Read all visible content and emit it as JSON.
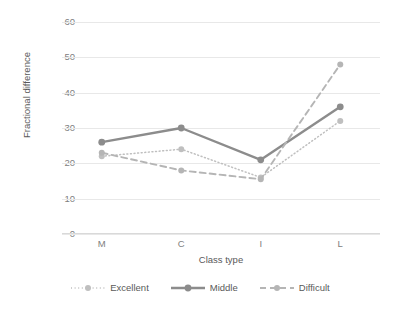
{
  "chart_data": {
    "type": "line",
    "title": "",
    "xlabel": "Class type",
    "ylabel": "Fractional difference",
    "categories": [
      "M",
      "C",
      "I",
      "L"
    ],
    "ylim": [
      0,
      60
    ],
    "yticks": [
      0,
      10,
      20,
      30,
      40,
      50,
      60
    ],
    "grid": true,
    "legend_position": "bottom",
    "series": [
      {
        "name": "Excellent",
        "values": [
          22,
          24,
          16,
          32
        ],
        "color": "#bfbfbf",
        "linestyle": "dotted",
        "marker": "circle"
      },
      {
        "name": "Middle",
        "values": [
          26,
          30,
          21,
          36
        ],
        "color": "#8c8c8c",
        "linestyle": "solid",
        "marker": "circle"
      },
      {
        "name": "Difficult",
        "values": [
          23,
          18,
          15.5,
          48
        ],
        "color": "#b5b5b5",
        "linestyle": "dashed",
        "marker": "circle"
      }
    ]
  },
  "axes": {
    "y_title": "Fractional difference",
    "x_title": "Class type",
    "y_tick_labels": [
      "60",
      "50",
      "40",
      "30",
      "20",
      "10",
      "0"
    ],
    "x_tick_labels": [
      "M",
      "C",
      "I",
      "L"
    ]
  },
  "legend": {
    "items": [
      {
        "label": "Excellent"
      },
      {
        "label": "Middle"
      },
      {
        "label": "Difficult"
      }
    ]
  }
}
